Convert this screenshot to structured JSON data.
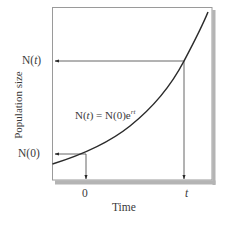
{
  "chart_data": {
    "type": "line",
    "title": "",
    "xlabel": "Time",
    "ylabel": "Population size",
    "x_ticks": [
      "0",
      "t"
    ],
    "y_ticks": [
      "N(0)",
      "N(t)"
    ],
    "equation": {
      "lhs": "N(t)",
      "eq": "=",
      "rhs_base": "N(0)e",
      "rhs_exp": "rt",
      "full": "N(t) = N(0)e^rt"
    },
    "series": [
      {
        "name": "Exponential growth",
        "description": "N(t) = N(0)e^(rt), exponential curve rising from low left to steep upper right",
        "x": [
          -0.35,
          0,
          0.25,
          0.5,
          0.75,
          1.0,
          1.2
        ],
        "values": [
          0.08,
          0.14,
          0.27,
          0.45,
          0.69,
          1.0,
          1.35
        ]
      }
    ],
    "annotations": [
      {
        "type": "arrow",
        "from": "curve at t=0",
        "to": "y-axis",
        "label": "N(0)"
      },
      {
        "type": "arrow",
        "from": "curve at t=0",
        "to": "x-axis",
        "label": "0"
      },
      {
        "type": "arrow",
        "from": "curve at t",
        "to": "y-axis",
        "label": "N(t)"
      },
      {
        "type": "arrow",
        "from": "curve at t",
        "to": "x-axis",
        "label": "t"
      }
    ],
    "grid": false,
    "legend": "none",
    "colors": {
      "curve": "#2b2b2b",
      "frame": "#8c8c8c",
      "shadow": "#b4b4b4",
      "arrows": "#4a4a4a"
    }
  }
}
